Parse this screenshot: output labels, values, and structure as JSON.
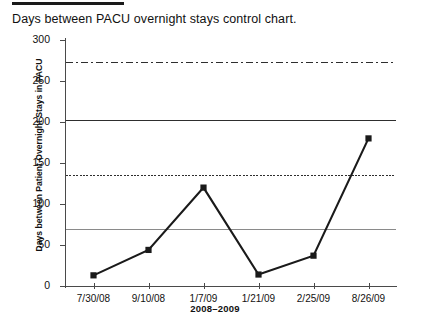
{
  "chart_data": {
    "type": "line",
    "title": "Days between PACU overnight stays control chart.",
    "xlabel": "2008–2009",
    "ylabel": "Days between Patient Overnight Stays in PACU",
    "categories": [
      "7/30/08",
      "9/10/08",
      "1/7/09",
      "1/21/09",
      "2/25/09",
      "8/26/09"
    ],
    "values": [
      13,
      44,
      120,
      14,
      37,
      180
    ],
    "series": [
      {
        "name": "Days between PACU overnight stays",
        "values": [
          13,
          44,
          120,
          14,
          37,
          180
        ],
        "marker": "square",
        "color": "#1a1a1a"
      }
    ],
    "ylim": [
      0,
      300
    ],
    "yticks": [
      0,
      50,
      100,
      150,
      200,
      250,
      300
    ],
    "ytick_labels": [
      "0",
      "50",
      "100",
      "150",
      "200",
      "250",
      "300"
    ],
    "grid": false,
    "legend": "none",
    "reference_lines": [
      {
        "name": "upper-limit-line",
        "value": 273,
        "style": "dash-dot",
        "color": "#2e2e2e"
      },
      {
        "name": "upper-warning-line",
        "value": 203,
        "style": "long-dash",
        "color": "#2e2e2e"
      },
      {
        "name": "lower-warning-line",
        "value": 135,
        "style": "dotted",
        "color": "#2e2e2e"
      },
      {
        "name": "center-line",
        "value": 70,
        "style": "solid",
        "color": "#8a8a8a"
      }
    ]
  },
  "colors": {
    "axis": "#4a4a4a",
    "series": "#1a1a1a",
    "reference": "#2e2e2e",
    "center": "#8a8a8a",
    "background": "#ffffff",
    "text": "#111111"
  }
}
